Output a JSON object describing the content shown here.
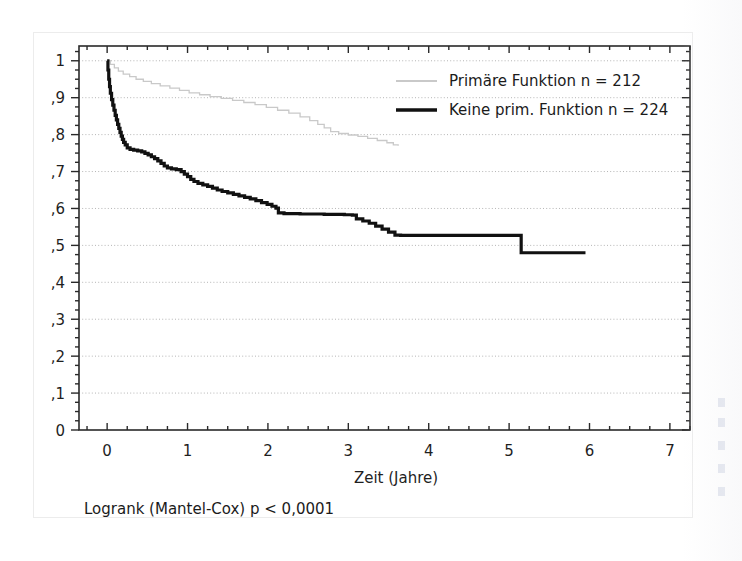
{
  "figure": {
    "footnote": "Logrank (Mantel-Cox) p < 0,0001"
  },
  "chart_data": {
    "type": "line",
    "title": "",
    "subtitle": "",
    "xlabel": "Zeit  (Jahre)",
    "ylabel": "",
    "xlim": [
      -0.35,
      7.25
    ],
    "ylim": [
      0,
      1.04
    ],
    "xticks": [
      0,
      1,
      2,
      3,
      4,
      5,
      6,
      7
    ],
    "xticklabels": [
      "0",
      "1",
      "2",
      "3",
      "4",
      "5",
      "6",
      "7"
    ],
    "yticks": [
      0,
      0.1,
      0.2,
      0.3,
      0.4,
      0.5,
      0.6,
      0.7,
      0.8,
      0.9,
      1.0
    ],
    "yticklabels": [
      "0",
      ",1",
      ",2",
      ",3",
      ",4",
      ",5",
      ",6",
      ",7",
      ",8",
      ",9",
      "1"
    ],
    "grid": true,
    "grid_axis": "y",
    "grid_style": "dotted",
    "legend_position": "top-right",
    "curve_style": "kaplan-meier-step",
    "series": [
      {
        "name": "Primäre Funktion n = 212",
        "label": "Primäre Funktion",
        "n": 212,
        "color": "#c9c9c9",
        "linewidth": 1.3,
        "points": [
          [
            0.0,
            1.0
          ],
          [
            0.04,
            0.99
          ],
          [
            0.09,
            0.981
          ],
          [
            0.14,
            0.972
          ],
          [
            0.2,
            0.964
          ],
          [
            0.28,
            0.957
          ],
          [
            0.36,
            0.95
          ],
          [
            0.45,
            0.944
          ],
          [
            0.55,
            0.938
          ],
          [
            0.66,
            0.932
          ],
          [
            0.78,
            0.926
          ],
          [
            0.9,
            0.92
          ],
          [
            1.02,
            0.913
          ],
          [
            1.15,
            0.908
          ],
          [
            1.28,
            0.903
          ],
          [
            1.42,
            0.898
          ],
          [
            1.56,
            0.893
          ],
          [
            1.7,
            0.887
          ],
          [
            1.84,
            0.881
          ],
          [
            1.98,
            0.874
          ],
          [
            2.12,
            0.866
          ],
          [
            2.26,
            0.858
          ],
          [
            2.4,
            0.848
          ],
          [
            2.52,
            0.838
          ],
          [
            2.62,
            0.828
          ],
          [
            2.7,
            0.818
          ],
          [
            2.78,
            0.808
          ],
          [
            2.88,
            0.803
          ],
          [
            3.0,
            0.799
          ],
          [
            3.12,
            0.795
          ],
          [
            3.24,
            0.79
          ],
          [
            3.36,
            0.784
          ],
          [
            3.48,
            0.778
          ],
          [
            3.56,
            0.772
          ],
          [
            3.62,
            0.77
          ]
        ]
      },
      {
        "name": "Keine prim. Funktion n = 224",
        "label": "Keine prim. Funktion",
        "n": 224,
        "color": "#111111",
        "linewidth": 3.2,
        "points": [
          [
            0.0,
            1.0
          ],
          [
            0.01,
            0.975
          ],
          [
            0.02,
            0.95
          ],
          [
            0.03,
            0.93
          ],
          [
            0.04,
            0.912
          ],
          [
            0.055,
            0.895
          ],
          [
            0.07,
            0.88
          ],
          [
            0.085,
            0.866
          ],
          [
            0.1,
            0.852
          ],
          [
            0.115,
            0.84
          ],
          [
            0.13,
            0.828
          ],
          [
            0.145,
            0.817
          ],
          [
            0.16,
            0.806
          ],
          [
            0.175,
            0.796
          ],
          [
            0.19,
            0.787
          ],
          [
            0.205,
            0.779
          ],
          [
            0.225,
            0.772
          ],
          [
            0.25,
            0.764
          ],
          [
            0.285,
            0.76
          ],
          [
            0.33,
            0.758
          ],
          [
            0.38,
            0.756
          ],
          [
            0.43,
            0.753
          ],
          [
            0.47,
            0.749
          ],
          [
            0.51,
            0.745
          ],
          [
            0.55,
            0.74
          ],
          [
            0.59,
            0.735
          ],
          [
            0.63,
            0.729
          ],
          [
            0.67,
            0.722
          ],
          [
            0.71,
            0.715
          ],
          [
            0.75,
            0.71
          ],
          [
            0.8,
            0.707
          ],
          [
            0.86,
            0.705
          ],
          [
            0.92,
            0.7
          ],
          [
            0.96,
            0.693
          ],
          [
            1.0,
            0.686
          ],
          [
            1.04,
            0.679
          ],
          [
            1.08,
            0.673
          ],
          [
            1.13,
            0.668
          ],
          [
            1.19,
            0.664
          ],
          [
            1.25,
            0.66
          ],
          [
            1.31,
            0.655
          ],
          [
            1.37,
            0.65
          ],
          [
            1.43,
            0.646
          ],
          [
            1.5,
            0.642
          ],
          [
            1.57,
            0.638
          ],
          [
            1.64,
            0.634
          ],
          [
            1.71,
            0.63
          ],
          [
            1.78,
            0.626
          ],
          [
            1.85,
            0.621
          ],
          [
            1.92,
            0.616
          ],
          [
            1.99,
            0.611
          ],
          [
            2.05,
            0.606
          ],
          [
            2.1,
            0.601
          ],
          [
            2.13,
            0.588
          ],
          [
            2.2,
            0.586
          ],
          [
            2.4,
            0.585
          ],
          [
            2.7,
            0.584
          ],
          [
            2.95,
            0.583
          ],
          [
            3.05,
            0.582
          ],
          [
            3.1,
            0.572
          ],
          [
            3.18,
            0.566
          ],
          [
            3.26,
            0.56
          ],
          [
            3.34,
            0.552
          ],
          [
            3.42,
            0.544
          ],
          [
            3.5,
            0.536
          ],
          [
            3.58,
            0.528
          ],
          [
            3.65,
            0.527
          ],
          [
            4.0,
            0.527
          ],
          [
            4.5,
            0.527
          ],
          [
            5.0,
            0.527
          ],
          [
            5.14,
            0.527
          ],
          [
            5.15,
            0.48
          ],
          [
            5.5,
            0.48
          ],
          [
            5.95,
            0.48
          ]
        ]
      }
    ]
  }
}
